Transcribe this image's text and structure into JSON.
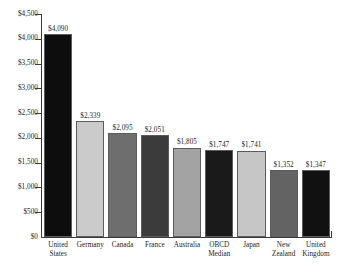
{
  "chart_data": {
    "type": "bar",
    "title": "",
    "subtitle": "",
    "xlabel": "",
    "ylabel": "",
    "ylim": [
      0,
      4500
    ],
    "grid": false,
    "legend": "none",
    "y_tick_labels": [
      "$4,500",
      "$4,000",
      "$3,500",
      "$3,000",
      "$2,500",
      "$2,000",
      "$1,500",
      "$1,000",
      "$500",
      "$0"
    ],
    "y_tick_values": [
      4500,
      4000,
      3500,
      3000,
      2500,
      2000,
      1500,
      1000,
      500,
      0
    ],
    "categories": [
      "United States",
      "Germany",
      "Canada",
      "France",
      "Australia",
      "OBCD Median",
      "Japan",
      "New Zealand",
      "United Kingdom"
    ],
    "category_lines": [
      [
        "United",
        "States"
      ],
      [
        "Germany"
      ],
      [
        "Canada"
      ],
      [
        "France"
      ],
      [
        "Australia"
      ],
      [
        "OBCD",
        "Median"
      ],
      [
        "Japan"
      ],
      [
        "New",
        "Zealand"
      ],
      [
        "United",
        "Kingdom"
      ]
    ],
    "values": [
      4090,
      2339,
      2095,
      2051,
      1805,
      1747,
      1741,
      1352,
      1347
    ],
    "value_labels": [
      "$4,090",
      "$2,339",
      "$2,095",
      "$2,051",
      "$1,805",
      "$1,747",
      "$1,741",
      "$1,352",
      "$1,347"
    ],
    "bar_colors": [
      "#0d0d0d",
      "#cbcbcb",
      "#6e6e6e",
      "#3b3b3b",
      "#a3a3a3",
      "#1a1a1a",
      "#c6c6c6",
      "#636363",
      "#111111"
    ]
  }
}
